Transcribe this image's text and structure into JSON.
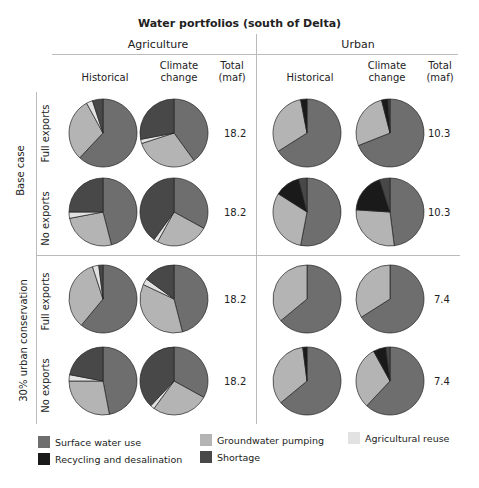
{
  "chart_data": {
    "type": "pie",
    "title": "Water portfolios (south of Delta)",
    "column_groups": [
      "Agriculture",
      "Urban"
    ],
    "columns": [
      "Historical",
      "Climate change",
      "Total (maf)"
    ],
    "row_groups": [
      "Base case",
      "30% urban conservation"
    ],
    "rows": [
      "Full exports",
      "No exports"
    ],
    "categories": [
      "Surface water use",
      "Groundwater pumping",
      "Agricultural reuse",
      "Recycling and desalination",
      "Shortage"
    ],
    "colors": {
      "Surface water use": "#6e6e6e",
      "Groundwater pumping": "#b4b4b4",
      "Agricultural reuse": "#e2e2e2",
      "Recycling and desalination": "#1a1a1a",
      "Shortage": "#484848"
    },
    "pies": [
      {
        "scenario": "Base case",
        "exports": "Full exports",
        "sector": "Agriculture",
        "climate": "Historical",
        "values": [
          62,
          30,
          3,
          0,
          5
        ]
      },
      {
        "scenario": "Base case",
        "exports": "Full exports",
        "sector": "Agriculture",
        "climate": "Climate change",
        "values": [
          40,
          30,
          2,
          0,
          28
        ]
      },
      {
        "scenario": "Base case",
        "exports": "Full exports",
        "sector": "Urban",
        "climate": "Historical",
        "values": [
          66,
          31,
          0,
          3,
          0
        ]
      },
      {
        "scenario": "Base case",
        "exports": "Full exports",
        "sector": "Urban",
        "climate": "Climate change",
        "values": [
          69,
          27,
          0,
          3,
          1
        ]
      },
      {
        "scenario": "Base case",
        "exports": "No exports",
        "sector": "Agriculture",
        "climate": "Historical",
        "values": [
          46,
          26,
          3,
          0,
          25
        ]
      },
      {
        "scenario": "Base case",
        "exports": "No exports",
        "sector": "Agriculture",
        "climate": "Climate change",
        "values": [
          33,
          25,
          2,
          0,
          40
        ]
      },
      {
        "scenario": "Base case",
        "exports": "No exports",
        "sector": "Urban",
        "climate": "Historical",
        "values": [
          53,
          31,
          0,
          12,
          4
        ]
      },
      {
        "scenario": "Base case",
        "exports": "No exports",
        "sector": "Urban",
        "climate": "Climate change",
        "values": [
          48,
          28,
          0,
          19,
          5
        ]
      },
      {
        "scenario": "30% urban conservation",
        "exports": "Full exports",
        "sector": "Agriculture",
        "climate": "Historical",
        "values": [
          61,
          34,
          3,
          0,
          2
        ]
      },
      {
        "scenario": "30% urban conservation",
        "exports": "Full exports",
        "sector": "Agriculture",
        "climate": "Climate change",
        "values": [
          46,
          36,
          3,
          0,
          15
        ]
      },
      {
        "scenario": "30% urban conservation",
        "exports": "Full exports",
        "sector": "Urban",
        "climate": "Historical",
        "values": [
          64,
          36,
          0,
          0,
          0
        ]
      },
      {
        "scenario": "30% urban conservation",
        "exports": "Full exports",
        "sector": "Urban",
        "climate": "Climate change",
        "values": [
          66,
          34,
          0,
          0,
          0
        ]
      },
      {
        "scenario": "30% urban conservation",
        "exports": "No exports",
        "sector": "Agriculture",
        "climate": "Historical",
        "values": [
          47,
          28,
          3,
          0,
          22
        ]
      },
      {
        "scenario": "30% urban conservation",
        "exports": "No exports",
        "sector": "Agriculture",
        "climate": "Climate change",
        "values": [
          33,
          27,
          2,
          0,
          38
        ]
      },
      {
        "scenario": "30% urban conservation",
        "exports": "No exports",
        "sector": "Urban",
        "climate": "Historical",
        "values": [
          64,
          34,
          0,
          2,
          0
        ]
      },
      {
        "scenario": "30% urban conservation",
        "exports": "No exports",
        "sector": "Urban",
        "climate": "Climate change",
        "values": [
          62,
          30,
          0,
          6,
          2
        ]
      }
    ],
    "totals_maf": {
      "base_full_ag": "18.2",
      "base_full_urban": "10.3",
      "base_no_ag": "18.2",
      "base_no_urban": "10.3",
      "cons_full_ag": "18.2",
      "cons_full_urban": "7.4",
      "cons_no_ag": "18.2",
      "cons_no_urban": "7.4"
    }
  },
  "labels": {
    "title": "Water portfolios (south of Delta)",
    "agriculture": "Agriculture",
    "urban": "Urban",
    "historical": "Historical",
    "climate1": "Climate",
    "climate2": "change",
    "total1": "Total",
    "total2": "(maf)",
    "base_case": "Base case",
    "conservation": "30% urban conservation",
    "full_exports": "Full exports",
    "no_exports": "No exports"
  },
  "legend": [
    {
      "label": "Surface water use",
      "color": "#6e6e6e"
    },
    {
      "label": "Groundwater pumping",
      "color": "#b4b4b4"
    },
    {
      "label": "Agricultural reuse",
      "color": "#e2e2e2"
    },
    {
      "label": "Recycling and desalination",
      "color": "#1a1a1a"
    },
    {
      "label": "Shortage",
      "color": "#484848"
    }
  ]
}
